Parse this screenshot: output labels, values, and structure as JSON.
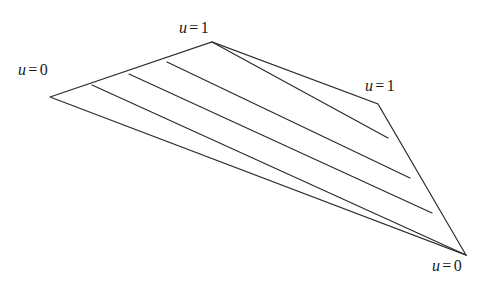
{
  "figure": {
    "stroke_color": "#2b2b2b",
    "background_color": "#ffffff",
    "stroke_width": 1.2
  },
  "labels": {
    "left": {
      "var": "u",
      "eq": "=",
      "value": "0",
      "text": "u = 0"
    },
    "top": {
      "var": "u",
      "eq": "=",
      "value": "1",
      "text": "u = 1"
    },
    "right": {
      "var": "u",
      "eq": "=",
      "value": "1",
      "text": "u = 1"
    },
    "bottom": {
      "var": "u",
      "eq": "=",
      "value": "0",
      "text": "u = 0"
    }
  },
  "geometry": {
    "vertices": {
      "left_apex": [
        50,
        97
      ],
      "top_apex": [
        212,
        42
      ],
      "right_kink": [
        378,
        104
      ],
      "bottom_right": [
        466,
        255
      ]
    },
    "boundary_outline": "50,97 212,42 378,104 466,255 50,97",
    "rulings": [
      {
        "from": [
          92,
          85
        ],
        "to": [
          466,
          255
        ]
      },
      {
        "from": [
          129,
          74
        ],
        "to": [
          432,
          213
        ]
      },
      {
        "from": [
          167,
          62
        ],
        "to": [
          410,
          178
        ]
      },
      {
        "from": [
          212,
          42
        ],
        "to": [
          388,
          138
        ]
      }
    ]
  }
}
